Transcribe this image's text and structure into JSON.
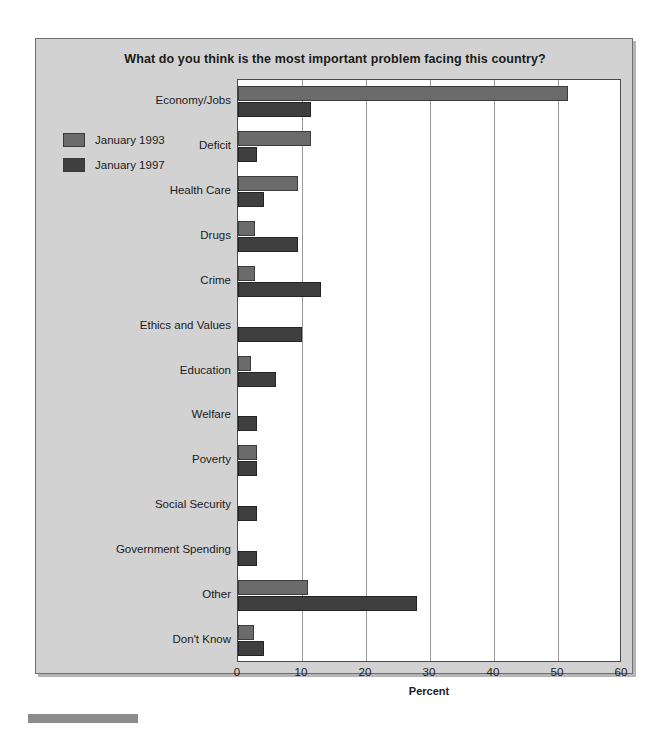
{
  "chart_data": {
    "type": "bar",
    "orientation": "horizontal",
    "title": "What do you think is the most important problem facing this country?",
    "xlabel": "Percent",
    "ylabel": "",
    "xlim": [
      0,
      60
    ],
    "xticks": [
      0,
      10,
      20,
      30,
      40,
      50,
      60
    ],
    "grid": true,
    "legend_position": "left",
    "categories": [
      "Economy/Jobs",
      "Deficit",
      "Health Care",
      "Drugs",
      "Crime",
      "Ethics and Values",
      "Education",
      "Welfare",
      "Poverty",
      "Social Security",
      "Government Spending",
      "Other",
      "Don't Know"
    ],
    "series": [
      {
        "name": "January 1993",
        "color": "#6b6b6b",
        "values": [
          51.5,
          11.4,
          9.3,
          2.7,
          2.7,
          0,
          2.0,
          0,
          3.0,
          0,
          0,
          11.0,
          2.5
        ]
      },
      {
        "name": "January 1997",
        "color": "#3f3f3f",
        "values": [
          11.4,
          3.0,
          4.0,
          9.3,
          13.0,
          10.0,
          6.0,
          3.0,
          3.0,
          3.0,
          3.0,
          28.0,
          4.0
        ]
      }
    ]
  },
  "legend": {
    "items": [
      {
        "label": "January 1993",
        "color": "#6b6b6b"
      },
      {
        "label": "January 1997",
        "color": "#3f3f3f"
      }
    ]
  }
}
